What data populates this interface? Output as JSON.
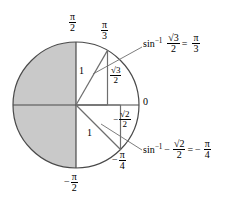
{
  "diagram": {
    "colors": {
      "shaded_region": "#c9c9c9",
      "outline": "#4a4a4a",
      "axis": "#4a4a4a",
      "leader": "#6e6e6e",
      "text": "#000000"
    },
    "circle": {
      "center_x": 76,
      "center_y": 105,
      "radius": 63
    },
    "axis_labels": {
      "top": {
        "num": "π",
        "den": "2"
      },
      "bottom": {
        "sign": "−",
        "num": "π",
        "den": "2"
      },
      "right": "0"
    },
    "angle_labels": {
      "upper": {
        "num": "π",
        "den": "3"
      },
      "lower": {
        "sign": "−",
        "num": "π",
        "den": "4"
      }
    },
    "triangles": [
      {
        "name": "upper-triangle",
        "angle_degrees": 60,
        "hypotenuse_label": "1",
        "opposite_label": {
          "num": "√3",
          "den": "2"
        }
      },
      {
        "name": "lower-triangle",
        "angle_degrees": -45,
        "hypotenuse_label": "1",
        "opposite_label": {
          "sign": "−",
          "num": "√2",
          "den": "2"
        }
      }
    ],
    "annotations": [
      {
        "name": "arcsin-root3-over-2",
        "function": "sin",
        "exponent": "−1",
        "sign": "",
        "arg_num": "√3",
        "arg_den": "2",
        "equals": "=",
        "result_sign": "",
        "result_num": "π",
        "result_den": "3"
      },
      {
        "name": "arcsin-neg-root2-over-2",
        "function": "sin",
        "exponent": "−1",
        "sign": "−",
        "arg_num": "√2",
        "arg_den": "2",
        "equals": "=",
        "result_sign": "−",
        "result_num": "π",
        "result_den": "4"
      }
    ]
  }
}
